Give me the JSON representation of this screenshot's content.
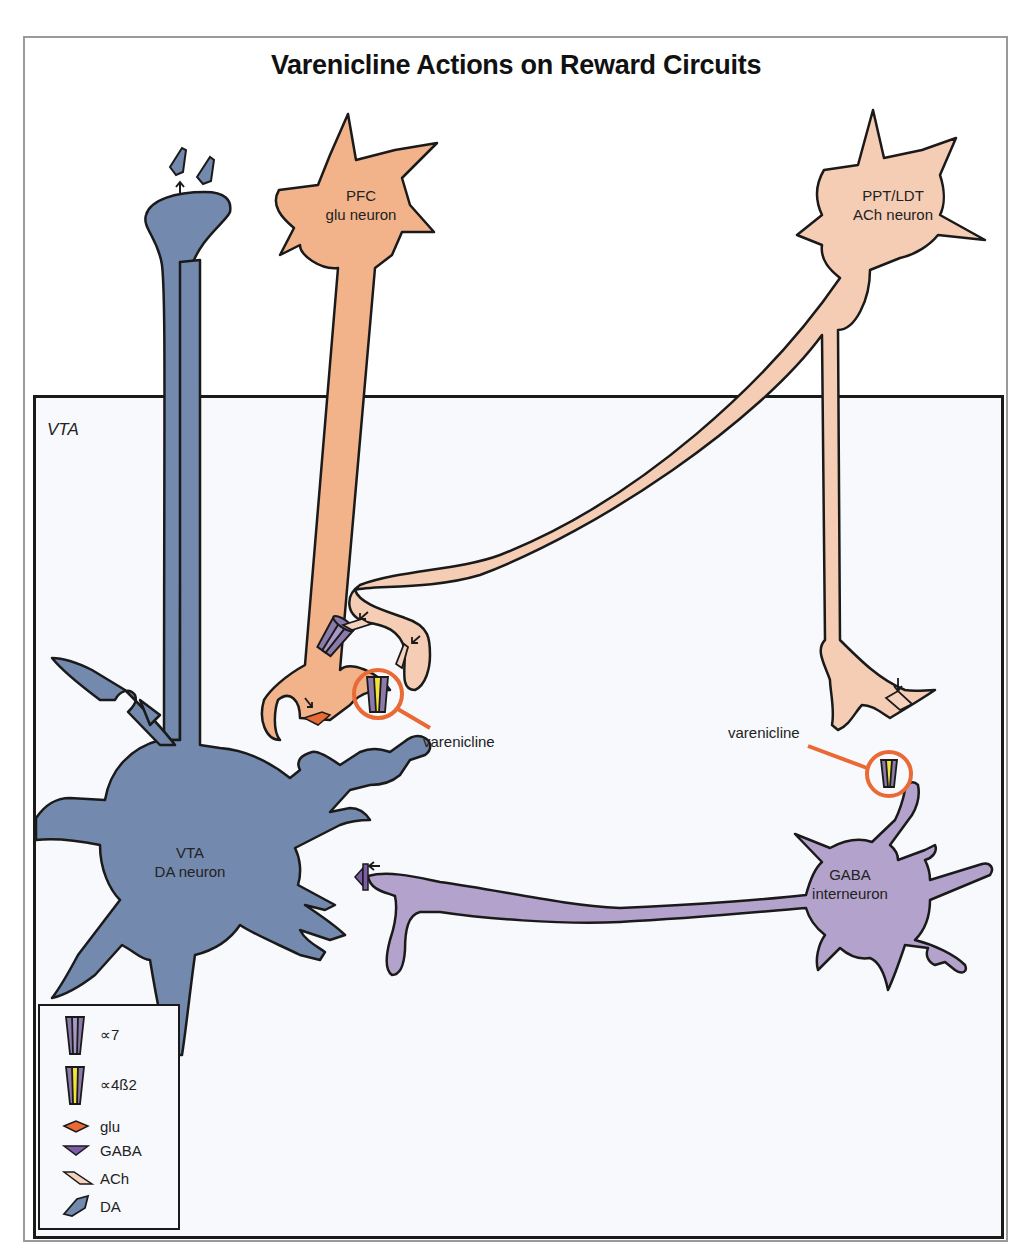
{
  "title": "Varenicline Actions on Reward Circuits",
  "region_label": "VTA",
  "neurons": {
    "pfc": {
      "line1": "PFC",
      "line2": "glu neuron",
      "color": "#f2b38a"
    },
    "ppt_ldt": {
      "line1": "PPT/LDT",
      "line2": "ACh neuron",
      "color": "#f5cdb4"
    },
    "vta_da": {
      "line1": "VTA",
      "line2": "DA neuron",
      "color": "#7389ad"
    },
    "gaba": {
      "line1": "GABA",
      "line2": "interneuron",
      "color": "#b3a3cc"
    }
  },
  "annotations": {
    "varenicline_left": "varenicline",
    "varenicline_right": "varenicline",
    "highlight_color": "#ea6a35"
  },
  "legend": {
    "items": [
      {
        "icon": "alpha7-receptor-icon",
        "label": "∝7"
      },
      {
        "icon": "alpha4beta2-receptor-icon",
        "label": "∝4ß2"
      },
      {
        "icon": "glu-icon",
        "label": "glu",
        "color": "#ea6a35"
      },
      {
        "icon": "gaba-icon",
        "label": "GABA",
        "color": "#7d5ea6"
      },
      {
        "icon": "ach-icon",
        "label": "ACh",
        "color": "#f5d2bd"
      },
      {
        "icon": "da-icon",
        "label": "DA",
        "color": "#7389ad"
      }
    ]
  }
}
